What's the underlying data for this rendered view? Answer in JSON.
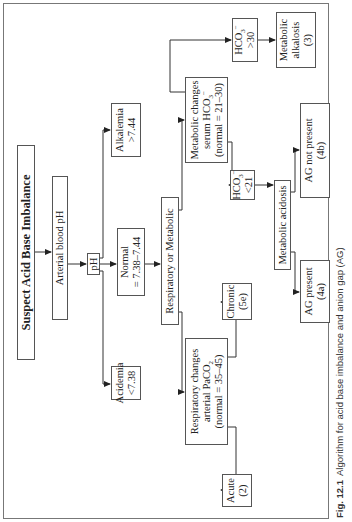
{
  "title": "Suspect Acid Base Imbalance",
  "nodes": {
    "arterial": "Arterial blood pH",
    "ph": "pH",
    "acidemia": [
      "Acidemia",
      "<7.38"
    ],
    "normal": [
      "Normal",
      "= 7.38–7.44"
    ],
    "alkalemia": [
      "Alkalemia",
      ">7.44"
    ],
    "resp_or_met": "Respiratory or Metabolic",
    "resp_changes": [
      "Respiratory changes",
      "arterial PaCO",
      "2",
      "(normal = 35–45)"
    ],
    "acute": [
      "Acute",
      "(2)"
    ],
    "chronic": [
      "Chronic",
      "(5e)"
    ],
    "met_changes": [
      "Metabolic changes",
      "serum HCO",
      "3",
      "−",
      "(normal = 21–30)"
    ],
    "hco3_low": [
      "HCO",
      "3",
      "−",
      "<21"
    ],
    "hco3_high": [
      "HCO",
      "3",
      "−",
      ">30"
    ],
    "met_alkalosis": [
      "Metabolic",
      "alkalosis",
      "(3)"
    ],
    "met_acidosis": "Metabolic acidosis",
    "ag_present": [
      "AG present",
      "(4a)"
    ],
    "ag_not_present": [
      "AG not present",
      "(4b)"
    ]
  },
  "caption": {
    "label": "Fig. 12.1",
    "text": "Algorithm for acid base imbalance and anion gap (AG)"
  }
}
